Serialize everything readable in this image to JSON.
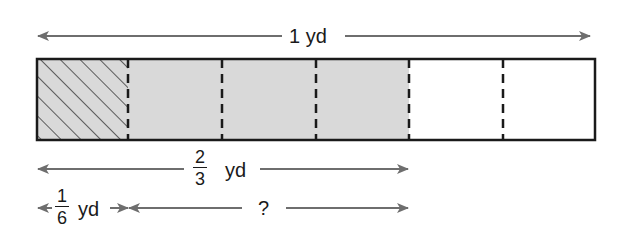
{
  "diagram": {
    "type": "fraction-bar-model",
    "total_label": {
      "value": "1",
      "unit": "yd"
    },
    "bar": {
      "parts": 6,
      "segments": [
        {
          "index": 1,
          "fill": "hatched",
          "color": "#d9d9d9"
        },
        {
          "index": 2,
          "fill": "shaded",
          "color": "#d9d9d9"
        },
        {
          "index": 3,
          "fill": "shaded",
          "color": "#d9d9d9"
        },
        {
          "index": 4,
          "fill": "shaded",
          "color": "#d9d9d9"
        },
        {
          "index": 5,
          "fill": "empty",
          "color": "#ffffff"
        },
        {
          "index": 6,
          "fill": "empty",
          "color": "#ffffff"
        }
      ]
    },
    "measure_two_thirds": {
      "numerator": "2",
      "denominator": "3",
      "unit": "yd"
    },
    "measure_one_sixth": {
      "numerator": "1",
      "denominator": "6",
      "unit": "yd"
    },
    "unknown_label": "?",
    "colors": {
      "arrow": "#6e6e6e",
      "outline": "#1a1a1a",
      "shade": "#d9d9d9"
    }
  }
}
